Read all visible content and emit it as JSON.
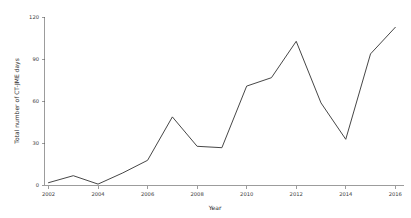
{
  "chart_data": {
    "type": "line",
    "title": "",
    "subtitle": "",
    "xlabel": "Year",
    "ylabel": "Total number of CT-JME days",
    "x": [
      2002,
      2003,
      2004,
      2005,
      2006,
      2007,
      2008,
      2009,
      2010,
      2011,
      2012,
      2013,
      2014,
      2015,
      2016
    ],
    "values": [
      2,
      7,
      1,
      9,
      18,
      49,
      28,
      27,
      71,
      77,
      103,
      59,
      33,
      94,
      113
    ],
    "series": [
      {
        "name": "Total number of CT-JME days",
        "color": "#3c3c3c",
        "values": [
          2,
          7,
          1,
          9,
          18,
          49,
          28,
          27,
          71,
          77,
          103,
          59,
          33,
          94,
          113
        ]
      }
    ],
    "xlim": [
      2002,
      2016
    ],
    "ylim": [
      0,
      120
    ],
    "xticks": [
      2002,
      2004,
      2006,
      2008,
      2010,
      2012,
      2014,
      2016
    ],
    "xtick_labels": [
      "2002",
      "2004",
      "2006",
      "2008",
      "2010",
      "2012",
      "2014",
      "2016"
    ],
    "yticks": [
      0,
      30,
      60,
      90,
      120
    ],
    "ytick_labels": [
      "0",
      "30",
      "60",
      "90",
      "120"
    ],
    "grid": false,
    "legend": false,
    "legend_position": "none",
    "annotations": []
  },
  "figure": {
    "background_color": "#ffffff",
    "axis_color": "#5a5a5a",
    "line_color": "#3c3c3c",
    "text_color": "#2b2b2b"
  }
}
